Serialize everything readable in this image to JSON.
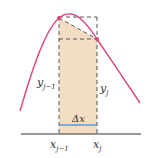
{
  "diagram": {
    "labels": {
      "y_left": "y",
      "y_left_sub": "j−1",
      "y_right": "y",
      "y_right_sub": "j",
      "x_left": "x",
      "x_left_sub": "j−1",
      "x_right": "x",
      "x_right_sub": "j",
      "delta_x": "Δx"
    },
    "colors": {
      "curve": "#e0457a",
      "shade": "#f2dcc4",
      "dashed": "#555555",
      "delta_bar": "#5b9bd5",
      "axis": "#333333",
      "point": "#e0457a"
    }
  }
}
